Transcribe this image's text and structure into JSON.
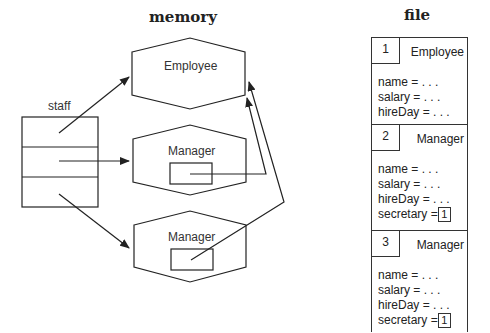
{
  "memory": {
    "title": "memory",
    "array_label": "staff",
    "objects": [
      {
        "type": "Employee"
      },
      {
        "type": "Manager"
      },
      {
        "type": "Manager"
      }
    ]
  },
  "file": {
    "title": "file",
    "records": [
      {
        "index": "1",
        "type": "Employee",
        "fields": [
          "name = . . .",
          "salary = . . .",
          "hireDay = . . ."
        ]
      },
      {
        "index": "2",
        "type": "Manager",
        "fields": [
          "name = . . .",
          "salary = . . .",
          "hireDay = . . ."
        ],
        "secretary_label": "secretary =",
        "secretary_ref": "1"
      },
      {
        "index": "3",
        "type": "Manager",
        "fields": [
          "name = . . .",
          "salary = . . .",
          "hireDay = . . ."
        ],
        "secretary_label": "secretary =",
        "secretary_ref": "1"
      }
    ]
  },
  "colors": {
    "stroke": "#222222",
    "background": "#ffffff"
  }
}
